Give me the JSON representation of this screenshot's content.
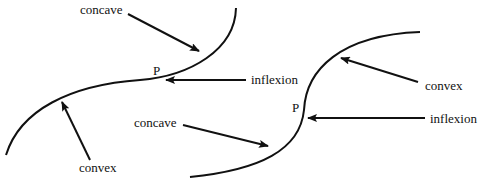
{
  "figure": {
    "left": {
      "label_concave": "concave",
      "label_convex": "convex",
      "label_inflexion": "inflexion",
      "label_point": "P"
    },
    "right": {
      "label_concave": "concave",
      "label_convex": "convex",
      "label_inflexion": "inflexion",
      "label_point": "P"
    }
  }
}
